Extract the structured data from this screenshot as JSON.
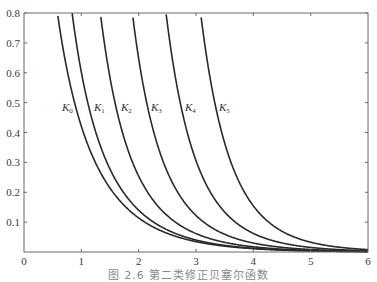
{
  "chart_data": {
    "type": "line",
    "title": "",
    "caption": "图 2.6   第二类修正贝塞尔函数",
    "xlabel": "",
    "ylabel": "",
    "xlim": [
      0,
      6
    ],
    "ylim": [
      0,
      0.8
    ],
    "grid": false,
    "legend_position": "inline labels near curves at y≈0.48",
    "x_ticks": [
      "0",
      "1",
      "2",
      "3",
      "4",
      "5",
      "6"
    ],
    "y_ticks": [
      "0.1",
      "0.2",
      "0.3",
      "0.4",
      "0.5",
      "0.6",
      "0.7",
      "0.8"
    ],
    "series": [
      {
        "name": "K0",
        "label_main": "K",
        "label_sub": "0",
        "order": 0,
        "x": [
          0.58,
          1,
          2,
          3,
          4,
          5,
          6
        ],
        "values": [
          0.8,
          0.421,
          0.114,
          0.035,
          0.011,
          0.004,
          0.001
        ]
      },
      {
        "name": "K1",
        "label_main": "K",
        "label_sub": "1",
        "order": 1,
        "x": [
          0.86,
          1,
          2,
          3,
          4,
          5,
          6
        ],
        "values": [
          0.8,
          0.602,
          0.14,
          0.04,
          0.012,
          0.004,
          0.001
        ]
      },
      {
        "name": "K2",
        "label_main": "K",
        "label_sub": "2",
        "order": 2,
        "x": [
          1.35,
          2,
          3,
          4,
          5,
          6
        ],
        "values": [
          0.8,
          0.254,
          0.062,
          0.017,
          0.005,
          0.002
        ]
      },
      {
        "name": "K3",
        "label_main": "K",
        "label_sub": "3",
        "order": 3,
        "x": [
          1.9,
          2,
          3,
          4,
          5,
          6
        ],
        "values": [
          0.8,
          0.647,
          0.122,
          0.03,
          0.008,
          0.002
        ]
      },
      {
        "name": "K4",
        "label_main": "K",
        "label_sub": "4",
        "order": 4,
        "x": [
          2.5,
          3,
          4,
          5,
          6
        ],
        "values": [
          0.8,
          0.301,
          0.06,
          0.015,
          0.004
        ]
      },
      {
        "name": "K5",
        "label_main": "K",
        "label_sub": "5",
        "order": 5,
        "x": [
          3.1,
          4,
          5,
          6
        ],
        "values": [
          0.8,
          0.136,
          0.033,
          0.008
        ]
      }
    ],
    "label_positions": [
      {
        "x": 62,
        "y": 111
      },
      {
        "x": 94,
        "y": 111
      },
      {
        "x": 121,
        "y": 111
      },
      {
        "x": 151,
        "y": 111
      },
      {
        "x": 185,
        "y": 111
      },
      {
        "x": 219,
        "y": 111
      }
    ],
    "colors": {
      "curve": "#2a2a2a",
      "axis": "#6a6a6a",
      "text": "#3a3a3a"
    }
  }
}
